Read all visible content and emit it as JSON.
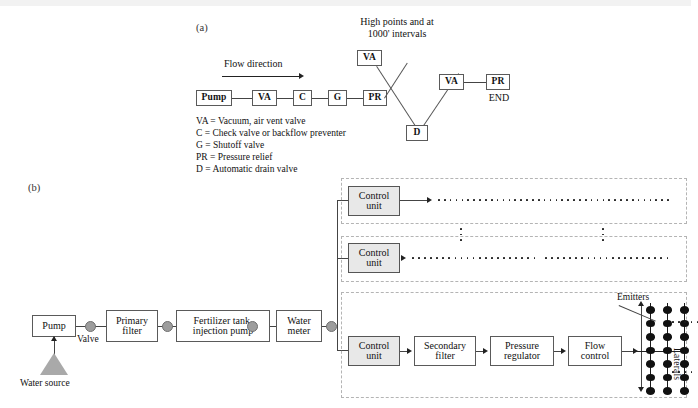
{
  "figure": {
    "panel_a_id": "(a)",
    "panel_b_id": "(b)"
  },
  "panel_a": {
    "heading_line1": "High points and at",
    "heading_line2": "1000' intervals",
    "flow_label": "Flow direction",
    "mainline_nodes": [
      {
        "label": "Pump"
      },
      {
        "label": "VA"
      },
      {
        "label": "C"
      },
      {
        "label": "G"
      },
      {
        "label": "PR"
      }
    ],
    "high_point_node": "VA",
    "low_point_node": "D",
    "end_nodes": [
      {
        "label": "VA"
      },
      {
        "label": "PR"
      }
    ],
    "end_label": "END",
    "legend": [
      "VA = Vacuum, air vent valve",
      "C = Check valve or backflow preventer",
      "G = Shutoff valve",
      "PR = Pressure relief",
      "D = Automatic drain valve"
    ]
  },
  "panel_b": {
    "headworks": [
      {
        "label_line1": "Pump",
        "label_line2": ""
      },
      {
        "label_line1": "Primary",
        "label_line2": "filter"
      },
      {
        "label_line1": "Fertilizer tank,",
        "label_line2": "injection pump"
      },
      {
        "label_line1": "Water",
        "label_line2": "meter"
      }
    ],
    "valve_label": "Valve",
    "water_source_label": "Water source",
    "zones": [
      {
        "control_line1": "Control",
        "control_line2": "unit"
      },
      {
        "control_line1": "Control",
        "control_line2": "unit"
      },
      {
        "control_line1": "Control",
        "control_line2": "unit"
      }
    ],
    "zone3_chain": [
      {
        "line1": "Control",
        "line2": "unit"
      },
      {
        "line1": "Secondary",
        "line2": "filter"
      },
      {
        "line1": "Pressure",
        "line2": "regulator"
      },
      {
        "line1": "Flow",
        "line2": "control"
      }
    ],
    "emitters_label": "Emitters",
    "laterals_label": "Laterals"
  },
  "colors": {
    "line": "#444444",
    "shaded_box": "#e8e8e8",
    "valve": "#9d9d9d",
    "zone_border": "#b4b4b4",
    "water_source": "#a9a9a9"
  }
}
